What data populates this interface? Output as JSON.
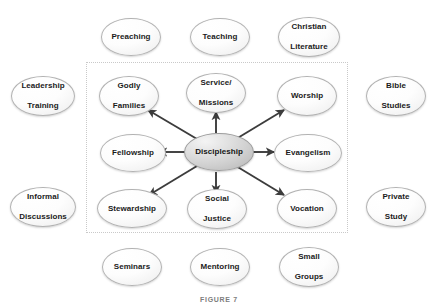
{
  "figure": {
    "caption": "FIGURE 7",
    "frame_style": "dotted",
    "background_color": "#ffffff",
    "accent_colors": {
      "oval_border": "#b2b2b2",
      "hub_fill": "#cfcfcf",
      "arrow": "#3c3c3c",
      "frame_border": "#c9c9c9",
      "text": "#1b1b1b"
    }
  },
  "hub": {
    "label": "Discipleship",
    "cx": 219,
    "cy": 152,
    "rx": 35,
    "ry": 19
  },
  "inner_nodes": [
    {
      "id": "godly-families",
      "label_line1": "Godly",
      "label_line2": "Families",
      "cx": 129,
      "cy": 96,
      "direction": "up-left"
    },
    {
      "id": "service-missions",
      "label_line1": "Service/",
      "label_line2": "Missions",
      "cx": 216,
      "cy": 93,
      "direction": "up"
    },
    {
      "id": "worship",
      "label_line1": "Worship",
      "label_line2": "",
      "cx": 307,
      "cy": 96,
      "direction": "up-right"
    },
    {
      "id": "fellowship",
      "label_line1": "Fellowship",
      "label_line2": "",
      "cx": 133,
      "cy": 152,
      "direction": "left"
    },
    {
      "id": "evangelism",
      "label_line1": "Evangelism",
      "label_line2": "",
      "cx": 308,
      "cy": 152,
      "direction": "right"
    },
    {
      "id": "stewardship",
      "label_line1": "Stewardship",
      "label_line2": "",
      "cx": 132,
      "cy": 208,
      "direction": "down-left"
    },
    {
      "id": "social-justice",
      "label_line1": "Social",
      "label_line2": "Justice",
      "cx": 217,
      "cy": 209,
      "direction": "down"
    },
    {
      "id": "vocation",
      "label_line1": "Vocation",
      "label_line2": "",
      "cx": 307,
      "cy": 208,
      "direction": "down-right"
    }
  ],
  "outer_nodes": [
    {
      "id": "preaching",
      "label_line1": "Preaching",
      "label_line2": "",
      "cx": 131,
      "cy": 37,
      "position": "top"
    },
    {
      "id": "teaching",
      "label_line1": "Teaching",
      "label_line2": "",
      "cx": 220,
      "cy": 37,
      "position": "top"
    },
    {
      "id": "christian-literature",
      "label_line1": "Christian",
      "label_line2": "Literature",
      "cx": 309,
      "cy": 37,
      "position": "top"
    },
    {
      "id": "leadership-training",
      "label_line1": "Leadership",
      "label_line2": "Training",
      "cx": 43,
      "cy": 96,
      "position": "left"
    },
    {
      "id": "informal-discussions",
      "label_line1": "Informal",
      "label_line2": "Discussions",
      "cx": 43,
      "cy": 207,
      "position": "left"
    },
    {
      "id": "bible-studies",
      "label_line1": "Bible",
      "label_line2": "Studies",
      "cx": 396,
      "cy": 96,
      "position": "right"
    },
    {
      "id": "private-study",
      "label_line1": "Private",
      "label_line2": "Study",
      "cx": 396,
      "cy": 207,
      "position": "right"
    },
    {
      "id": "seminars",
      "label_line1": "Seminars",
      "label_line2": "",
      "cx": 132,
      "cy": 267,
      "position": "bottom"
    },
    {
      "id": "mentoring",
      "label_line1": "Mentoring",
      "label_line2": "",
      "cx": 220,
      "cy": 267,
      "position": "bottom"
    },
    {
      "id": "small-groups",
      "label_line1": "Small",
      "label_line2": "Groups",
      "cx": 309,
      "cy": 267,
      "position": "bottom"
    }
  ]
}
